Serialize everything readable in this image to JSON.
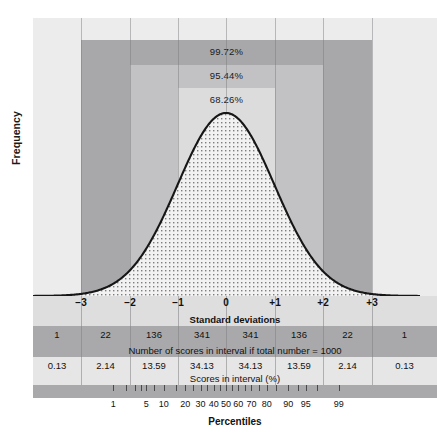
{
  "chart_data": {
    "type": "area",
    "title": "",
    "xlabel": "Standard deviations",
    "ylabel": "Frequency",
    "distribution": "normal",
    "grid": true,
    "x": [
      -3,
      -2,
      -1,
      0,
      1,
      2,
      3
    ],
    "xtick_labels": [
      "−3",
      "−2",
      "−1",
      "0",
      "+1",
      "+2",
      "+3"
    ],
    "xlim": [
      -4,
      4
    ],
    "ylim": [
      0,
      1
    ],
    "coverage_bands": [
      {
        "name": "three-sigma",
        "label": "99.72%",
        "range": [
          -3,
          3
        ],
        "color": "#a8a8aa"
      },
      {
        "name": "two-sigma",
        "label": "95.44%",
        "range": [
          -2,
          2
        ],
        "color": "#c2c2c4"
      },
      {
        "name": "one-sigma",
        "label": "68.26%",
        "range": [
          -1,
          1
        ],
        "color": "#dcdcdd"
      }
    ],
    "intervals": [
      "−∞ to −3",
      "−3 to −2",
      "−2 to −1",
      "−1 to 0",
      "0 to +1",
      "+1 to +2",
      "+2 to +3",
      "+3 to ∞"
    ],
    "counts_caption": "Number of scores in interval if total number = 1000",
    "counts": [
      "1",
      "22",
      "136",
      "341",
      "341",
      "136",
      "22",
      "1"
    ],
    "percent_caption": "Scores in interval (%)",
    "percents": [
      "0.13",
      "2.14",
      "13.59",
      "34.13",
      "34.13",
      "13.59",
      "2.14",
      "0.13"
    ],
    "percentile_axis_label": "Percentiles",
    "percentile_ticks": [
      1,
      5,
      10,
      20,
      30,
      40,
      50,
      60,
      70,
      80,
      90,
      95,
      99
    ],
    "percentile_labels": [
      "1",
      "5",
      "10",
      "20",
      "30",
      "40",
      "50",
      "60",
      "70",
      "80",
      "90",
      "95",
      "99"
    ]
  },
  "figure": {
    "y_axis_label": "Frequency",
    "x_axis_label": "Standard deviations",
    "percentiles_label": "Percentiles",
    "band_labels": {
      "outer": "99.72%",
      "middle": "95.44%",
      "inner": "68.26%"
    },
    "counts_caption": "Number of scores in interval if total number = 1000",
    "percent_caption": "Scores in interval (%)",
    "sd_ticks": [
      "−3",
      "−2",
      "−1",
      "0",
      "+1",
      "+2",
      "+3"
    ],
    "counts": [
      "1",
      "22",
      "136",
      "341",
      "341",
      "136",
      "22",
      "1"
    ],
    "percents": [
      "0.13",
      "2.14",
      "13.59",
      "34.13",
      "34.13",
      "13.59",
      "2.14",
      "0.13"
    ],
    "percentile_labels": [
      "1",
      "5",
      "10",
      "20",
      "30",
      "40",
      "50",
      "60",
      "70",
      "80",
      "90",
      "95",
      "99"
    ],
    "colors": {
      "plot_background": "#ececed",
      "band_outer": "#a8a8aa",
      "band_middle": "#c2c2c4",
      "band_inner": "#dcdcdd",
      "row_dark": "#a9a9ab",
      "row_light": "#e6e6e7",
      "row_axis": "#dededf",
      "curve_line": "#161616"
    }
  }
}
